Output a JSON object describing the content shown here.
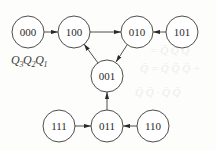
{
  "diagram": {
    "type": "state-transition",
    "variable_label": {
      "parts": [
        {
          "base": "Q",
          "sub": "3"
        },
        {
          "base": "Q",
          "sub": "2"
        },
        {
          "base": "Q",
          "sub": "1"
        }
      ]
    },
    "states": [
      {
        "id": "s000",
        "label": "000",
        "cx": 28,
        "cy": 32,
        "r": 16
      },
      {
        "id": "s100",
        "label": "100",
        "cx": 74,
        "cy": 32,
        "r": 16
      },
      {
        "id": "s010",
        "label": "010",
        "cx": 137,
        "cy": 32,
        "r": 16
      },
      {
        "id": "s101",
        "label": "101",
        "cx": 182,
        "cy": 32,
        "r": 16
      },
      {
        "id": "s001",
        "label": "001",
        "cx": 107,
        "cy": 76,
        "r": 16
      },
      {
        "id": "s111",
        "label": "111",
        "cx": 59,
        "cy": 126,
        "r": 16
      },
      {
        "id": "s011",
        "label": "011",
        "cx": 107,
        "cy": 126,
        "r": 16
      },
      {
        "id": "s110",
        "label": "110",
        "cx": 153,
        "cy": 126,
        "r": 16
      }
    ],
    "transitions": [
      {
        "from": "000",
        "to": "100"
      },
      {
        "from": "100",
        "to": "010"
      },
      {
        "from": "101",
        "to": "010"
      },
      {
        "from": "010",
        "to": "001"
      },
      {
        "from": "001",
        "to": "100"
      },
      {
        "from": "011",
        "to": "001"
      },
      {
        "from": "111",
        "to": "011"
      },
      {
        "from": "110",
        "to": "011"
      }
    ],
    "colors": {
      "stroke": "#3a3a3a",
      "background": "#fdfdfc"
    }
  }
}
